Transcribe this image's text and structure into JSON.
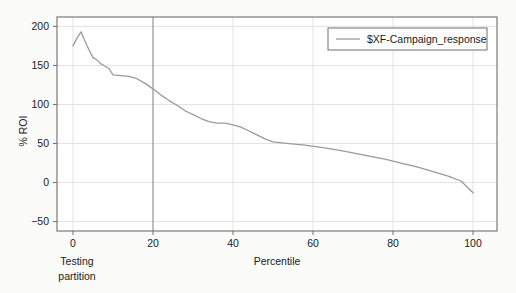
{
  "chart_data": {
    "type": "line",
    "title": "",
    "xlabel": "Percentile",
    "ylabel": "% ROI",
    "xlim": [
      -4,
      106
    ],
    "ylim": [
      -62,
      212
    ],
    "xticks": [
      0,
      20,
      40,
      60,
      80,
      100
    ],
    "yticks": [
      200,
      150,
      100,
      50,
      0,
      -50
    ],
    "xtick_labels": [
      "0",
      "20",
      "40",
      "60",
      "80",
      "100"
    ],
    "ytick_labels": [
      "200",
      "150",
      "100",
      "50",
      "0",
      "-50"
    ],
    "grid": true,
    "legend_position": "top-right",
    "series": [
      {
        "name": "$XF-Campaign_response",
        "color": "#9a9a9a",
        "x": [
          0,
          1,
          2,
          3,
          4,
          5,
          6,
          7,
          8,
          9,
          10,
          12,
          14,
          16,
          18,
          20,
          22,
          24,
          26,
          28,
          30,
          32,
          34,
          36,
          38,
          40,
          42,
          44,
          46,
          48,
          50,
          54,
          58,
          62,
          66,
          70,
          74,
          78,
          82,
          86,
          90,
          94,
          97,
          100
        ],
        "values": [
          175,
          185,
          193,
          181,
          170,
          160,
          157,
          152,
          149,
          146,
          138,
          137,
          136,
          133,
          127,
          120,
          112,
          105,
          99,
          92,
          87,
          82,
          78,
          76,
          76,
          74,
          71,
          66,
          61,
          56,
          52,
          50,
          48,
          45,
          42,
          38,
          34,
          30,
          25,
          20,
          14,
          8,
          2,
          -13
        ]
      }
    ],
    "annotations": [
      {
        "name": "partition-line",
        "type": "vline",
        "x": 20,
        "label": "Testing partition",
        "color": "#8a8a8a"
      }
    ]
  },
  "legend": {
    "entries": [
      {
        "label": "$XF-Campaign_response",
        "swatch_color": "#9a9a9a"
      }
    ]
  },
  "axes": {
    "y_title": "% ROI",
    "x_title": "Percentile"
  },
  "partition": {
    "line1": "Testing",
    "line2": "partition"
  },
  "colors": {
    "series": "#9a9a9a",
    "grid": "#e3e3e3",
    "frame": "#6f6f6f",
    "partition_line": "#8a8a8a",
    "background": "#fbfbfa",
    "plot_background": "#ffffff",
    "text": "#1a1a1a"
  }
}
